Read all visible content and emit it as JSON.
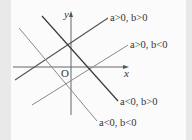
{
  "diagram": {
    "axes": {
      "x_label": "x",
      "y_label": "y",
      "origin_label": "O"
    },
    "lines": [
      {
        "label": "a>0, b>0",
        "slope": "positive",
        "y_intercept": "positive",
        "color": "#555555"
      },
      {
        "label": "a>0, b<0",
        "slope": "positive",
        "y_intercept": "negative",
        "color": "#8a8a8a"
      },
      {
        "label": "a<0, b>0",
        "slope": "negative",
        "y_intercept": "positive",
        "color": "#3a3a3a"
      },
      {
        "label": "a<0, b<0",
        "slope": "negative",
        "y_intercept": "negative",
        "color": "#8a8a8a"
      }
    ],
    "colors": {
      "background": "#fbfbfb",
      "border_strip": "#e9e9e9",
      "axis": "#666666"
    }
  }
}
